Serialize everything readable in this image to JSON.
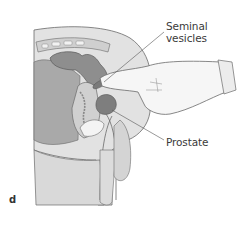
{
  "figure": {
    "panel_letter": "d",
    "labels": {
      "seminal_vesicles": [
        "Seminal",
        "vesicles"
      ],
      "prostate": "Prostate"
    },
    "colors": {
      "skin_light": "#e2e2e2",
      "tissue_mid": "#c8c8c8",
      "organ_dark": "#8e8e8e",
      "outline": "#6a6a6a",
      "glove": "#f6f6f6"
    }
  }
}
